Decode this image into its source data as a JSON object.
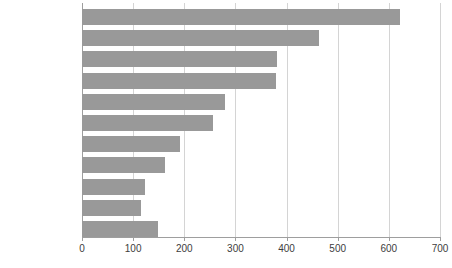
{
  "chart_data": {
    "type": "bar",
    "orientation": "horizontal",
    "title": "",
    "subtitle": "",
    "xlabel": "",
    "ylabel": "",
    "xlim": [
      0,
      700
    ],
    "ylim": null,
    "grid": true,
    "legend": false,
    "legend_position": "none",
    "bar_color": "#999999",
    "gridline_color": "#d4d4d4",
    "axis_color": "#9e9e9e",
    "text_color": "#3d3d3d",
    "x_ticks": [
      0,
      100,
      200,
      300,
      400,
      500,
      600,
      700
    ],
    "x_tick_labels": [
      "0",
      "100",
      "200",
      "300",
      "400",
      "500",
      "600",
      "700"
    ],
    "categories": [
      "£1000+",
      "£900 to < £1000",
      "£800 to < £900",
      "£700 to < £800",
      "£600 to < £700",
      "£500 to < £600",
      "£400 to < £500",
      "£300 to < £400",
      "£200 to < £300",
      "£100 to < £200",
      "< £100"
    ],
    "values": [
      621,
      464,
      381,
      379,
      280,
      257,
      191,
      162,
      124,
      116,
      149
    ]
  }
}
